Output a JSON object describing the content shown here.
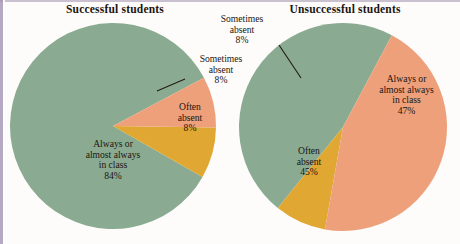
{
  "figure": {
    "background_color": "#fdfcfa",
    "border_color": "#a899b8"
  },
  "palette": {
    "green": "#8aab92",
    "gold": "#e0a832",
    "salmon": "#eda07a",
    "leader_line": "#231a12",
    "text": "#1c1510"
  },
  "charts": {
    "left": {
      "title": "Successful students",
      "labels": {
        "always": {
          "line1": "Always or",
          "line2": "almost always",
          "line3": "in class",
          "pct": "84%"
        },
        "often": {
          "line1": "Often",
          "line2": "absent",
          "pct": "8%"
        },
        "sometimes": {
          "line1": "Sometimes",
          "line2": "absent",
          "pct": "8%"
        }
      }
    },
    "right": {
      "title": "Unsuccessful students",
      "labels": {
        "always": {
          "line1": "Always or",
          "line2": "almost always",
          "line3": "in class",
          "pct": "47%"
        },
        "often": {
          "line1": "Often",
          "line2": "absent",
          "pct": "45%"
        },
        "sometimes": {
          "line1": "Sometimes",
          "line2": "absent",
          "pct": "8%"
        }
      }
    }
  },
  "chart_data": [
    {
      "type": "pie",
      "title": "Successful students",
      "categories": [
        "Always or almost always in class",
        "Sometimes absent",
        "Often absent"
      ],
      "values": [
        84,
        8,
        8
      ],
      "unit": "percent",
      "colors": [
        "#8aab92",
        "#e0a832",
        "#eda07a"
      ],
      "labels": [
        "84%",
        "8%",
        "8%"
      ],
      "legend": "none",
      "label_placement": [
        "inside",
        "outside-leader",
        "inside"
      ],
      "center": [
        113,
        126
      ],
      "radius": 103,
      "start_angle_deg": -28,
      "direction": "counterclockwise"
    },
    {
      "type": "pie",
      "title": "Unsuccessful students",
      "categories": [
        "Always or almost always in class",
        "Sometimes absent",
        "Often absent"
      ],
      "values": [
        47,
        8,
        45
      ],
      "unit": "percent",
      "colors": [
        "#8aab92",
        "#e0a832",
        "#eda07a"
      ],
      "labels": [
        "47%",
        "8%",
        "45%"
      ],
      "legend": "none",
      "label_placement": [
        "inside",
        "outside-leader",
        "inside"
      ],
      "center": [
        343,
        127
      ],
      "radius": 104,
      "start_angle_deg": -62,
      "direction": "counterclockwise"
    }
  ]
}
